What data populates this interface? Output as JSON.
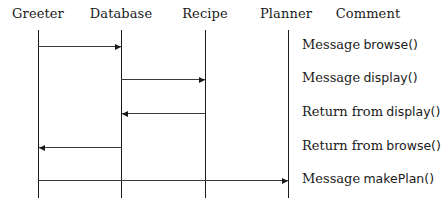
{
  "diagram": {
    "type": "sequence-diagram",
    "participants": [
      {
        "name": "Greeter",
        "x": 38
      },
      {
        "name": "Database",
        "x": 121
      },
      {
        "name": "Recipe",
        "x": 205
      },
      {
        "name": "Planner",
        "x": 288
      }
    ],
    "comment_header": "Comment",
    "messages": [
      {
        "from": "Greeter",
        "to": "Database",
        "y": 46,
        "direction": "right",
        "comment_prefix": "Message",
        "comment_method": "browse()"
      },
      {
        "from": "Database",
        "to": "Recipe",
        "y": 79,
        "direction": "right",
        "comment_prefix": "Message",
        "comment_method": "display()"
      },
      {
        "from": "Recipe",
        "to": "Database",
        "y": 113,
        "direction": "left",
        "comment_prefix": "Return from",
        "comment_method": "display()"
      },
      {
        "from": "Database",
        "to": "Greeter",
        "y": 147,
        "direction": "left",
        "comment_prefix": "Return from",
        "comment_method": "browse()"
      },
      {
        "from": "Greeter",
        "to": "Planner",
        "y": 180,
        "direction": "right",
        "comment_prefix": "Message",
        "comment_method": "makePlan()"
      }
    ]
  }
}
